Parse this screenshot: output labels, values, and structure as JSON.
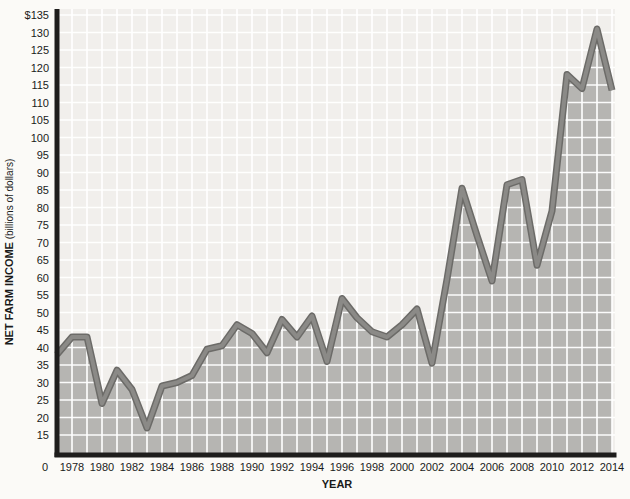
{
  "chart_data": {
    "type": "area",
    "title": "",
    "xlabel": "YEAR",
    "ylabel_main": "NET FARM INCOME",
    "ylabel_sub": " (billions of dollars)",
    "x": [
      1977,
      1978,
      1979,
      1980,
      1981,
      1982,
      1983,
      1984,
      1985,
      1986,
      1987,
      1988,
      1989,
      1990,
      1991,
      1992,
      1993,
      1994,
      1995,
      1996,
      1997,
      1998,
      1999,
      2000,
      2001,
      2002,
      2003,
      2004,
      2005,
      2006,
      2007,
      2008,
      2009,
      2010,
      2011,
      2012,
      2013,
      2014
    ],
    "values": [
      38,
      43,
      43,
      24,
      33.5,
      28,
      17,
      29,
      30,
      32,
      39.5,
      40.5,
      46.5,
      44,
      38.5,
      48,
      43,
      49,
      36,
      54,
      48.5,
      44.5,
      43,
      46.5,
      51,
      35.5,
      59.5,
      85.5,
      72,
      59,
      86.5,
      88,
      63.5,
      79,
      118,
      114,
      131,
      113.5
    ],
    "ylim": [
      0,
      135
    ],
    "grid": true,
    "legend": "none",
    "y_ticks": [
      15,
      20,
      25,
      30,
      35,
      40,
      45,
      50,
      55,
      60,
      65,
      70,
      75,
      80,
      85,
      90,
      95,
      100,
      105,
      110,
      115,
      120,
      125,
      130,
      135
    ],
    "y_tick_top_label": "$135",
    "x_tick_years": [
      1978,
      1980,
      1982,
      1984,
      1986,
      1988,
      1990,
      1992,
      1994,
      1996,
      1998,
      2000,
      2002,
      2004,
      2006,
      2008,
      2010,
      2012,
      2014
    ],
    "origin_label": "0",
    "colors": {
      "page_bg": "#fbfaf7",
      "plot_bg": "#f1efec",
      "area_fill": "#b6b5b2",
      "gridline": "#ffffff",
      "line_outer": "#6c6b68",
      "line_inner": "#8b8a87",
      "axis": "#1e1d1c",
      "text": "#1a1a1a"
    }
  }
}
